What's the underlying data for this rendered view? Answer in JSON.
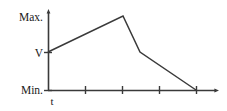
{
  "figure": {
    "background_color": "#ffffff",
    "line_color": "#3a3a3a",
    "axis_color": "#3a3a3a",
    "text_color": "#1a1a1a"
  },
  "labels": {
    "y_max": "Max.",
    "y_mid": "V",
    "y_min": "Min.",
    "x_axis": "t"
  },
  "chart_data": {
    "type": "line",
    "title": "",
    "xlabel": "t",
    "ylabel": "",
    "grid": false,
    "legend": null,
    "x_tick_labels": [
      "",
      "",
      "",
      ""
    ],
    "y_tick_labels": [
      "Min.",
      "V",
      "Max."
    ],
    "ylim": [
      "Min.",
      "Max."
    ],
    "xlim": [
      0,
      4.6
    ],
    "annotations": [
      "Max.",
      "V",
      "Min.",
      "t"
    ],
    "series": [
      {
        "name": "voltage",
        "x": [
          0,
          2.0,
          2.48,
          4.0
        ],
        "y": [
          "V",
          "Max.",
          "V",
          "Min."
        ],
        "points_px": [
          {
            "x": 48,
            "y": 52,
            "label": "V"
          },
          {
            "x": 123,
            "y": 16,
            "label": "Max."
          },
          {
            "x": 140,
            "y": 52,
            "label": "V"
          },
          {
            "x": 196,
            "y": 90,
            "label": "Min."
          }
        ],
        "description": "Rises linearly from V to Max., drops steeply back to V, then decays linearly to Min."
      }
    ],
    "x_ticks_px": [
      85,
      122,
      159,
      196
    ],
    "y_ticks_px": [
      16,
      52,
      90
    ],
    "axis_origin_px": {
      "x": 48,
      "y": 90
    },
    "y_axis_top_px": 12,
    "x_axis_right_px": 218
  }
}
